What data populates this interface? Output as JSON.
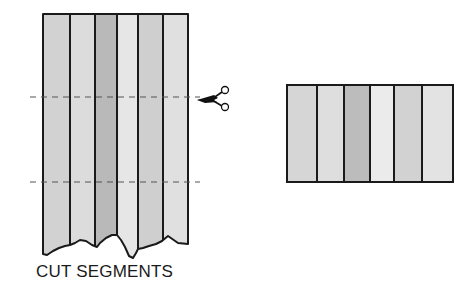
{
  "diagram": {
    "title": "",
    "caption": "CUT SEGMENTS",
    "colors": {
      "outline": "#1a1a1a",
      "dash": "#555555",
      "background": "#ffffff"
    },
    "left_panel": {
      "label": "long-strip-set",
      "strips": [
        {
          "shade": "#d2d2d2"
        },
        {
          "shade": "#dcdcdc"
        },
        {
          "shade": "#b9b9b9"
        },
        {
          "shade": "#e6e6e6"
        },
        {
          "shade": "#cfcfcf"
        },
        {
          "shade": "#e0e0e0"
        }
      ],
      "cut_lines": 2,
      "tool": "scissors"
    },
    "right_panel": {
      "label": "cut-segment",
      "strips": [
        {
          "shade": "#d6d6d6"
        },
        {
          "shade": "#dedede"
        },
        {
          "shade": "#bcbcbc"
        },
        {
          "shade": "#ebebeb"
        },
        {
          "shade": "#d2d2d2"
        },
        {
          "shade": "#e3e3e3"
        }
      ]
    }
  }
}
